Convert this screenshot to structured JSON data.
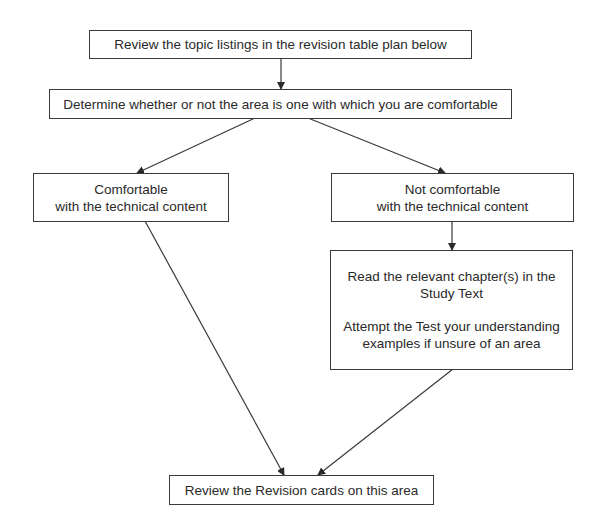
{
  "diagram": {
    "type": "flowchart",
    "nodes": {
      "review_topics": {
        "lines": [
          "Review the topic listings in the revision table plan below"
        ]
      },
      "determine": {
        "lines": [
          "Determine whether or not the area is one with which you are comfortable"
        ]
      },
      "comfortable": {
        "lines": [
          "Comfortable",
          "with the technical content"
        ]
      },
      "not_comfortable": {
        "lines": [
          "Not comfortable",
          "with the technical content"
        ]
      },
      "read_chapters": {
        "lines": [
          "Read the relevant chapter(s) in the",
          "Study Text",
          "Attempt the Test your understanding",
          "examples if unsure of an area"
        ]
      },
      "review_cards": {
        "lines": [
          "Review the Revision cards on this area"
        ]
      }
    },
    "edges": [
      {
        "from": "review_topics",
        "to": "determine"
      },
      {
        "from": "determine",
        "to": "comfortable"
      },
      {
        "from": "determine",
        "to": "not_comfortable"
      },
      {
        "from": "not_comfortable",
        "to": "read_chapters"
      },
      {
        "from": "comfortable",
        "to": "review_cards"
      },
      {
        "from": "read_chapters",
        "to": "review_cards"
      }
    ],
    "colors": {
      "stroke": "#3a3a3a",
      "background": "#ffffff",
      "text": "#2a2a2a"
    }
  }
}
